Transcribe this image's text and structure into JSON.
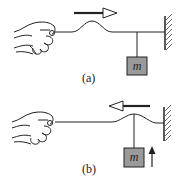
{
  "figure": {
    "panels": [
      {
        "id": "a",
        "caption": "(a)",
        "mass_label": "m",
        "pulse_direction": "right",
        "mass_motion": "none"
      },
      {
        "id": "b",
        "caption": "(b)",
        "mass_label": "m",
        "pulse_direction": "left",
        "mass_motion": "up"
      }
    ],
    "colors": {
      "line": "#222222",
      "mass_fill": "#9a9a9a",
      "background": "#ffffff"
    }
  }
}
